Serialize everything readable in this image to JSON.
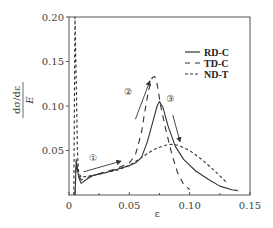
{
  "chart_data": {
    "type": "line",
    "title": "",
    "xlabel": "ε",
    "ylabel": "dσ/dε / E",
    "ylabel_numerator": "dσ/dε",
    "ylabel_denominator": "E",
    "xlim": [
      0,
      0.15
    ],
    "ylim": [
      0,
      0.2
    ],
    "xticks": [
      0,
      0.05,
      0.1,
      0.15
    ],
    "xtick_labels": [
      "0",
      "0.05",
      "0.10",
      "0.15"
    ],
    "yticks": [
      0.05,
      0.1,
      0.15,
      0.2
    ],
    "ytick_labels": [
      "0.05",
      "0.10",
      "0.15",
      "0.20"
    ],
    "grid": false,
    "legend_position": "upper right",
    "series": [
      {
        "name": "RD-C",
        "style": "solid",
        "x": [
          0.005,
          0.006,
          0.007,
          0.008,
          0.01,
          0.015,
          0.02,
          0.03,
          0.04,
          0.05,
          0.055,
          0.06,
          0.065,
          0.07,
          0.073,
          0.075,
          0.078,
          0.082,
          0.088,
          0.095,
          0.105,
          0.115,
          0.125,
          0.135,
          0.14
        ],
        "values": [
          0.0,
          0.04,
          0.03,
          0.02,
          0.013,
          0.018,
          0.022,
          0.025,
          0.029,
          0.033,
          0.036,
          0.042,
          0.06,
          0.085,
          0.1,
          0.105,
          0.098,
          0.078,
          0.055,
          0.04,
          0.027,
          0.018,
          0.01,
          0.006,
          0.005
        ]
      },
      {
        "name": "TD-C",
        "style": "long-dash",
        "x": [
          0.005,
          0.006,
          0.008,
          0.01,
          0.02,
          0.03,
          0.04,
          0.05,
          0.055,
          0.06,
          0.063,
          0.066,
          0.069,
          0.071,
          0.073,
          0.076,
          0.08,
          0.085,
          0.09,
          0.095,
          0.1
        ],
        "values": [
          0.0,
          0.035,
          0.022,
          0.017,
          0.022,
          0.026,
          0.03,
          0.036,
          0.045,
          0.07,
          0.095,
          0.118,
          0.132,
          0.133,
          0.125,
          0.1,
          0.075,
          0.047,
          0.025,
          0.012,
          0.006
        ]
      },
      {
        "name": "ND-T",
        "style": "short-dash",
        "x": [
          0.004,
          0.005,
          0.006,
          0.007,
          0.008,
          0.01,
          0.02,
          0.03,
          0.04,
          0.05,
          0.06,
          0.07,
          0.08,
          0.085,
          0.09,
          0.1,
          0.11,
          0.12,
          0.13
        ],
        "values": [
          0.0,
          0.2,
          0.13,
          0.05,
          0.025,
          0.02,
          0.022,
          0.025,
          0.028,
          0.033,
          0.042,
          0.051,
          0.056,
          0.057,
          0.056,
          0.05,
          0.04,
          0.028,
          0.015
        ]
      }
    ],
    "annotations": [
      {
        "label": "①",
        "x": 0.02,
        "y": 0.038,
        "note": "elastic/yield stage arrow"
      },
      {
        "label": "②",
        "x": 0.049,
        "y": 0.112,
        "note": "hardening stage arrow"
      },
      {
        "label": "③",
        "x": 0.084,
        "y": 0.104,
        "note": "softening stage arrow"
      }
    ]
  },
  "legend": {
    "items": [
      {
        "label": "RD-C",
        "style": "solid"
      },
      {
        "label": "TD-C",
        "style": "long-dash"
      },
      {
        "label": "ND-T",
        "style": "short-dash"
      }
    ]
  },
  "axes": {
    "x_title": "ε",
    "y_title_numerator": "dσ/dε",
    "y_title_denominator": "E"
  },
  "colors": {
    "line": "#333333",
    "axis": "#555555"
  }
}
